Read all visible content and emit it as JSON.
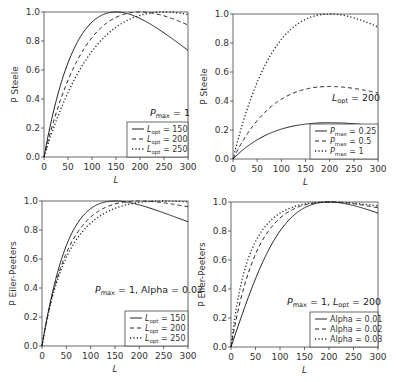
{
  "figure": {
    "panels": [
      {
        "id": "top-left",
        "model": "steele",
        "ylabel": "P Steele",
        "xlabel": "L",
        "annotation": "P_max = 1",
        "annotation_parts": {
          "main": "P",
          "sub": "max",
          "rest": " = 1"
        },
        "legend": [
          {
            "style": "solid",
            "label": "L_opt = 150",
            "main": "L",
            "sub": "opt",
            "rest": " = 150"
          },
          {
            "style": "dashed",
            "label": "L_opt = 200",
            "main": "L",
            "sub": "opt",
            "rest": " = 200"
          },
          {
            "style": "dotted",
            "label": "L_opt = 250",
            "main": "L",
            "sub": "opt",
            "rest": " = 250"
          }
        ]
      },
      {
        "id": "top-right",
        "model": "steele",
        "ylabel": "P Steele",
        "xlabel": "L",
        "annotation": "L_opt = 200",
        "annotation_parts": {
          "main": "L",
          "sub": "opt",
          "rest": " = 200"
        },
        "legend": [
          {
            "style": "solid",
            "label": "P_max = 0.25",
            "main": "P",
            "sub": "max",
            "rest": " = 0.25"
          },
          {
            "style": "dashed",
            "label": "P_max = 0.5",
            "main": "P",
            "sub": "max",
            "rest": " = 0.5"
          },
          {
            "style": "dotted",
            "label": "P_max = 1",
            "main": "P",
            "sub": "max",
            "rest": " = 1"
          }
        ]
      },
      {
        "id": "bottom-left",
        "model": "eilers-peeters",
        "ylabel": "P Eiler-Peeters",
        "xlabel": "L",
        "annotation": "P_max = 1, Alpha = 0.02",
        "annotation_parts": {
          "main": "P",
          "sub": "max",
          "rest": " = 1, Alpha = 0.02"
        },
        "legend": [
          {
            "style": "solid",
            "label": "L_opt = 150",
            "main": "L",
            "sub": "opt",
            "rest": " = 150"
          },
          {
            "style": "dashed",
            "label": "L_opt = 200",
            "main": "L",
            "sub": "opt",
            "rest": " = 200"
          },
          {
            "style": "dotted",
            "label": "L_opt = 250",
            "main": "L",
            "sub": "opt",
            "rest": " = 250"
          }
        ]
      },
      {
        "id": "bottom-right",
        "model": "eilers-peeters",
        "ylabel": "P Eiler-Peeters",
        "xlabel": "L",
        "annotation": "P_max = 1, L_opt = 200",
        "annotation_parts": {
          "main": "P",
          "sub": "max",
          "rest": " = 1, ",
          "main2": "L",
          "sub2": "opt",
          "rest2": " = 200"
        },
        "legend": [
          {
            "style": "solid",
            "label": "Alpha = 0.01",
            "main": "",
            "sub": "",
            "rest": "Alpha = 0.01"
          },
          {
            "style": "dashed",
            "label": "Alpha = 0.02",
            "main": "",
            "sub": "",
            "rest": "Alpha = 0.02"
          },
          {
            "style": "dotted",
            "label": "Alpha = 0.03",
            "main": "",
            "sub": "",
            "rest": "Alpha = 0.03"
          }
        ]
      }
    ]
  },
  "chart_data": [
    {
      "type": "line",
      "title": "",
      "xlabel": "L",
      "ylabel": "P Steele",
      "xlim": [
        0,
        300
      ],
      "ylim": [
        0,
        1
      ],
      "xticks": [
        0,
        50,
        100,
        150,
        200,
        250,
        300
      ],
      "yticks": [
        "0.0",
        "0.2",
        "0.4",
        "0.6",
        "0.8",
        "1.0"
      ],
      "grid": false,
      "legend_position": "lower right",
      "annotation": "P_max = 1",
      "x": [
        0,
        25,
        50,
        75,
        100,
        125,
        150,
        175,
        200,
        225,
        250,
        275,
        300
      ],
      "series": [
        {
          "name": "L_opt = 150",
          "style": "solid",
          "params": {
            "Pmax": 1,
            "Lopt": 150
          },
          "values": [
            0,
            0.41,
            0.7,
            0.88,
            0.97,
            0.99,
            1.0,
            0.99,
            0.96,
            0.91,
            0.86,
            0.8,
            0.74
          ]
        },
        {
          "name": "L_opt = 200",
          "style": "dashed",
          "params": {
            "Pmax": 1,
            "Lopt": 200
          },
          "values": [
            0,
            0.33,
            0.58,
            0.76,
            0.88,
            0.96,
            0.99,
            1.0,
            1.0,
            0.99,
            0.97,
            0.95,
            0.91
          ]
        },
        {
          "name": "L_opt = 250",
          "style": "dotted",
          "params": {
            "Pmax": 1,
            "Lopt": 250
          },
          "values": [
            0,
            0.27,
            0.49,
            0.66,
            0.8,
            0.9,
            0.95,
            0.99,
            1.0,
            1.0,
            1.0,
            1.0,
            0.98
          ]
        }
      ]
    },
    {
      "type": "line",
      "title": "",
      "xlabel": "L",
      "ylabel": "P Steele",
      "xlim": [
        0,
        300
      ],
      "ylim": [
        0,
        1
      ],
      "xticks": [
        0,
        50,
        100,
        150,
        200,
        250,
        300
      ],
      "yticks": [
        "0.0",
        "0.2",
        "0.4",
        "0.6",
        "0.8",
        "1.0"
      ],
      "grid": false,
      "legend_position": "lower right",
      "annotation": "L_opt = 200",
      "x": [
        0,
        25,
        50,
        75,
        100,
        125,
        150,
        175,
        200,
        225,
        250,
        275,
        300
      ],
      "series": [
        {
          "name": "P_max = 0.25",
          "style": "solid",
          "params": {
            "Pmax": 0.25,
            "Lopt": 200
          },
          "values": [
            0,
            0.08,
            0.15,
            0.19,
            0.22,
            0.24,
            0.25,
            0.25,
            0.25,
            0.25,
            0.24,
            0.24,
            0.23
          ]
        },
        {
          "name": "P_max = 0.5",
          "style": "dashed",
          "params": {
            "Pmax": 0.5,
            "Lopt": 200
          },
          "values": [
            0,
            0.16,
            0.29,
            0.38,
            0.44,
            0.48,
            0.49,
            0.5,
            0.5,
            0.5,
            0.49,
            0.47,
            0.45
          ]
        },
        {
          "name": "P_max = 1",
          "style": "dotted",
          "params": {
            "Pmax": 1,
            "Lopt": 200
          },
          "values": [
            0,
            0.33,
            0.58,
            0.76,
            0.88,
            0.96,
            0.99,
            1.0,
            1.0,
            0.99,
            0.97,
            0.95,
            0.91
          ]
        }
      ]
    },
    {
      "type": "line",
      "title": "",
      "xlabel": "L",
      "ylabel": "P Eiler-Peeters",
      "xlim": [
        0,
        300
      ],
      "ylim": [
        0,
        1
      ],
      "xticks": [
        0,
        50,
        100,
        150,
        200,
        250,
        300
      ],
      "yticks": [
        "0.0",
        "0.2",
        "0.4",
        "0.6",
        "0.8",
        "1.0"
      ],
      "grid": false,
      "legend_position": "lower right",
      "annotation": "P_max = 1, Alpha = 0.02",
      "x": [
        0,
        25,
        50,
        75,
        100,
        125,
        150,
        175,
        200,
        225,
        250,
        275,
        300
      ],
      "series": [
        {
          "name": "L_opt = 150",
          "style": "solid",
          "params": {
            "Pmax": 1,
            "Lopt": 150,
            "alpha": 0.02
          },
          "values": [
            0,
            0.42,
            0.69,
            0.86,
            0.95,
            0.99,
            1.0,
            0.99,
            0.97,
            0.94,
            0.91,
            0.88,
            0.86
          ]
        },
        {
          "name": "L_opt = 200",
          "style": "dashed",
          "params": {
            "Pmax": 1,
            "Lopt": 200,
            "alpha": 0.02
          },
          "values": [
            0,
            0.41,
            0.66,
            0.82,
            0.91,
            0.96,
            0.99,
            1.0,
            1.0,
            1.0,
            0.99,
            0.98,
            0.97
          ]
        },
        {
          "name": "L_opt = 250",
          "style": "dotted",
          "params": {
            "Pmax": 1,
            "Lopt": 250,
            "alpha": 0.02
          },
          "values": [
            0,
            0.4,
            0.64,
            0.79,
            0.88,
            0.94,
            0.97,
            0.99,
            1.0,
            1.0,
            1.0,
            1.0,
            0.99
          ]
        }
      ]
    },
    {
      "type": "line",
      "title": "",
      "xlabel": "L",
      "ylabel": "P Eiler-Peeters",
      "xlim": [
        0,
        300
      ],
      "ylim": [
        0,
        1
      ],
      "xticks": [
        0,
        50,
        100,
        150,
        200,
        250,
        300
      ],
      "yticks": [
        "0.0",
        "0.2",
        "0.4",
        "0.6",
        "0.8",
        "1.0"
      ],
      "grid": false,
      "legend_position": "lower right",
      "annotation": "P_max = 1, L_opt = 200",
      "x": [
        0,
        25,
        50,
        75,
        100,
        125,
        150,
        175,
        200,
        225,
        250,
        275,
        300
      ],
      "series": [
        {
          "name": "Alpha = 0.01",
          "style": "solid",
          "params": {
            "Pmax": 1,
            "Lopt": 200,
            "alpha": 0.01
          },
          "values": [
            0,
            0.23,
            0.44,
            0.62,
            0.77,
            0.88,
            0.95,
            0.99,
            1.0,
            0.99,
            0.98,
            0.96,
            0.93
          ]
        },
        {
          "name": "Alpha = 0.02",
          "style": "dashed",
          "params": {
            "Pmax": 1,
            "Lopt": 200,
            "alpha": 0.02
          },
          "values": [
            0,
            0.41,
            0.66,
            0.82,
            0.91,
            0.96,
            0.99,
            1.0,
            1.0,
            1.0,
            0.99,
            0.98,
            0.97
          ]
        },
        {
          "name": "Alpha = 0.03",
          "style": "dotted",
          "params": {
            "Pmax": 1,
            "Lopt": 200,
            "alpha": 0.03
          },
          "values": [
            0,
            0.54,
            0.77,
            0.88,
            0.94,
            0.98,
            0.99,
            1.0,
            1.0,
            1.0,
            1.0,
            0.99,
            0.98
          ]
        }
      ]
    }
  ]
}
